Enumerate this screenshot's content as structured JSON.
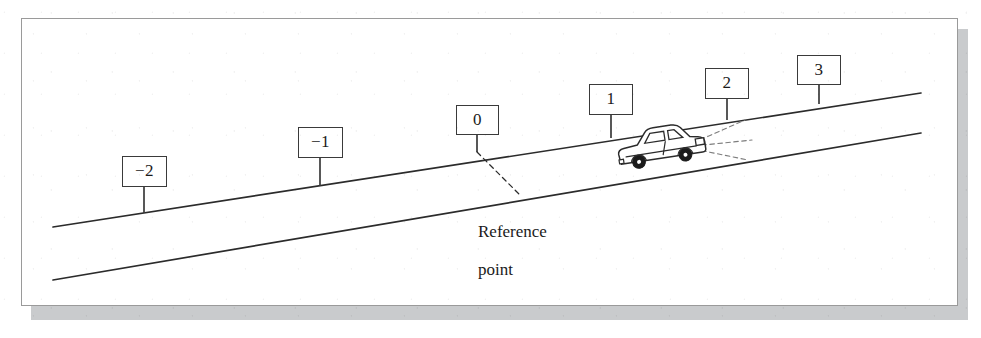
{
  "figure": {
    "background_color": "#ffffff",
    "line_color": "#2b2b2b",
    "frame_color": "#9a9a9a",
    "shadow_color": "#c9cbcd",
    "frame": {
      "x": 21,
      "y": 18,
      "width": 937,
      "height": 288
    },
    "shadow": {
      "x": 31,
      "y": 29,
      "width": 937,
      "height": 291
    }
  },
  "road": {
    "description": "Two parallel straight lines rising from left to right representing a sloped road",
    "upper_edge": {
      "x1": 53,
      "y1": 227,
      "x2": 921,
      "y2": 93
    },
    "lower_edge": {
      "x1": 53,
      "y1": 280,
      "x2": 921,
      "y2": 133
    }
  },
  "markers": [
    {
      "label": "−2",
      "value": -2,
      "box": {
        "x": 122,
        "y": 156,
        "width": 45,
        "height": 31
      },
      "post": {
        "x": 144,
        "y_top": 187,
        "y_bottom": 213
      }
    },
    {
      "label": "−1",
      "value": -1,
      "box": {
        "x": 298,
        "y": 127,
        "width": 45,
        "height": 31
      },
      "post": {
        "x": 320,
        "y_top": 158,
        "y_bottom": 186
      }
    },
    {
      "label": "0",
      "value": 0,
      "box": {
        "x": 456,
        "y": 105,
        "width": 43,
        "height": 30
      },
      "post": {
        "x": 477,
        "y_top": 135,
        "y_bottom": 152
      }
    },
    {
      "label": "1",
      "value": 1,
      "box": {
        "x": 589,
        "y": 84,
        "width": 44,
        "height": 31
      },
      "post": {
        "x": 611,
        "y_top": 115,
        "y_bottom": 138
      }
    },
    {
      "label": "2",
      "value": 2,
      "box": {
        "x": 705,
        "y": 68,
        "width": 44,
        "height": 31
      },
      "post": {
        "x": 727,
        "y_top": 99,
        "y_bottom": 120
      }
    },
    {
      "label": "3",
      "value": 3,
      "box": {
        "x": 797,
        "y": 55,
        "width": 44,
        "height": 30
      },
      "post": {
        "x": 819,
        "y_top": 85,
        "y_bottom": 104
      }
    }
  ],
  "annotation": {
    "text": "Reference\npoint",
    "line1": "Reference",
    "line2": "point",
    "position": {
      "x": 478,
      "y": 203
    },
    "leader": {
      "style": "dashed",
      "from": {
        "x": 477,
        "y": 152
      },
      "to": {
        "x": 519,
        "y": 194
      }
    }
  },
  "car": {
    "description": "Side view of a sedan travelling up the slope toward the right",
    "position": {
      "x": 613,
      "y": 131,
      "width": 90,
      "height": 44
    },
    "direction": "uphill-right",
    "headlight_beams": {
      "style": "dashed",
      "count": 3,
      "origin": {
        "x": 692,
        "y": 145
      }
    },
    "wheels": 2
  },
  "style": {
    "sign_font_size": "17px",
    "caption_font_size": "17px",
    "stroke_width": 1.6
  }
}
